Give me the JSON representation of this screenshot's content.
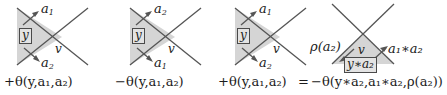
{
  "figure": {
    "type": "mathematical-diagram",
    "background_color": "#ffffff",
    "shade_color": "#d5d5d5",
    "line_color": "#4a4a4a",
    "box_fill": "#e3e3e3",
    "box_border": "#4a4a4a",
    "text_color": "#1b1b1b"
  },
  "panels": [
    {
      "id": "panel-1",
      "region_shape": "left-pointing-triangle",
      "labels": {
        "top_arc": "a",
        "top_arc_sub": "1",
        "bottom_arc": "a",
        "bottom_arc_sub": "2",
        "crossing": "v",
        "boxed": "y"
      },
      "formula": {
        "sign": "+",
        "theta": "θ",
        "open": "(",
        "args": "y,a₁,a₂",
        "close": ")",
        "plain": "+θ(y,a₁,a₂)"
      }
    },
    {
      "id": "panel-2",
      "region_shape": "left-pointing-triangle",
      "labels": {
        "top_arc": "a",
        "top_arc_sub": "2",
        "bottom_arc": "a",
        "bottom_arc_sub": "1",
        "crossing": "v",
        "boxed": "y"
      },
      "formula": {
        "sign": "−",
        "theta": "θ",
        "open": "(",
        "args": "y,a₁,a₂",
        "close": ")",
        "plain": "−θ(y,a₁,a₂)"
      }
    },
    {
      "id": "panel-3",
      "region_shape": "left-pointing-triangle",
      "labels": {
        "top_arc": "a",
        "top_arc_sub": "1",
        "bottom_arc": "a",
        "bottom_arc_sub": "2",
        "crossing": "v",
        "boxed": "y"
      },
      "formula": {
        "sign": "+",
        "theta": "θ",
        "open": "(",
        "args": "y,a₁,a₂",
        "close": ")",
        "plain": "+θ(y,a₁,a₂)"
      }
    },
    {
      "id": "panel-4",
      "region_shape": "down-pointing-triangle",
      "labels": {
        "left_arc": "ρ(a₂)",
        "right_arc": "a₁∗a₂",
        "crossing": "v",
        "boxed": "y∗a₂"
      },
      "formula": {
        "sign": "−",
        "theta": "θ",
        "open": "(",
        "args": "y∗a₂,a₁∗a₂,ρ(a₂)",
        "close": ")",
        "plain": "−θ(y∗a₂,a₁∗a₂,ρ(a₂))"
      }
    }
  ],
  "relation": {
    "equals": "="
  }
}
